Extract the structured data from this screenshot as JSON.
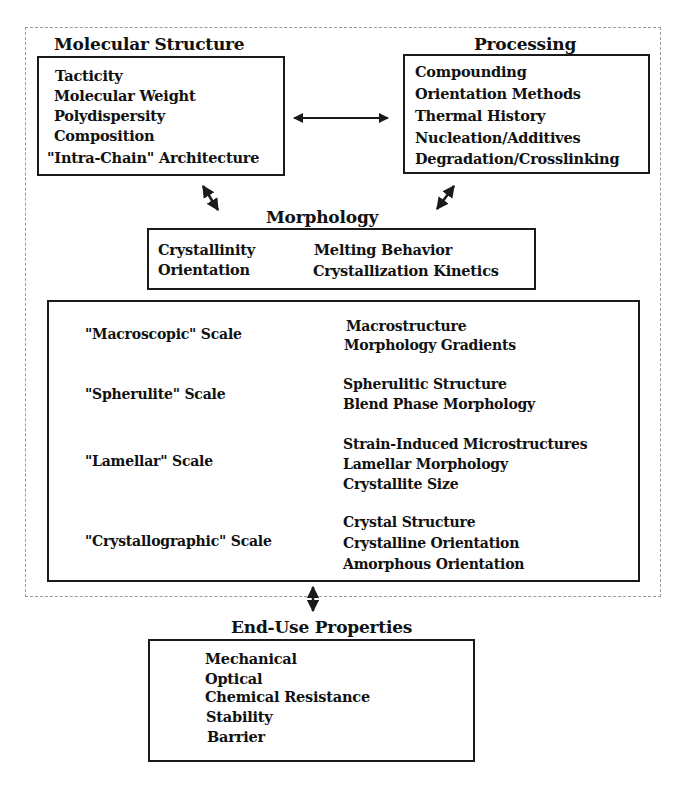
{
  "diagram": {
    "molecular_structure": {
      "title": "Molecular Structure",
      "items": [
        "Tacticity",
        "Molecular Weight",
        "Polydispersity",
        "Composition",
        "\"Intra-Chain\" Architecture"
      ]
    },
    "processing": {
      "title": "Processing",
      "items": [
        "Compounding",
        "Orientation Methods",
        "Thermal History",
        "Nucleation/Additives",
        "Degradation/Crosslinking"
      ]
    },
    "morphology": {
      "title": "Morphology",
      "left_items": [
        "Crystallinity",
        "Orientation"
      ],
      "right_items": [
        "Melting Behavior",
        "Crystallization Kinetics"
      ]
    },
    "scales": [
      {
        "label": "\"Macroscopic\" Scale",
        "items": [
          "Macrostructure",
          "Morphology Gradients"
        ]
      },
      {
        "label": "\"Spherulite\" Scale",
        "items": [
          "Spherulitic Structure",
          "Blend Phase Morphology"
        ]
      },
      {
        "label": "\"Lamellar\" Scale",
        "items": [
          "Strain-Induced Microstructures",
          "Lamellar Morphology",
          "Crystallite Size"
        ]
      },
      {
        "label": "\"Crystallographic\" Scale",
        "items": [
          "Crystal Structure",
          "Crystalline Orientation",
          "Amorphous Orientation"
        ]
      }
    ],
    "end_use": {
      "title": "End-Use Properties",
      "items": [
        "Mechanical",
        "Optical",
        "Chemical Resistance",
        "Stability",
        "Barrier"
      ]
    },
    "connectors": [
      {
        "from": "molecular_structure",
        "to": "processing",
        "type": "double-arrow"
      },
      {
        "from": "molecular_structure",
        "to": "morphology",
        "type": "double-arrow"
      },
      {
        "from": "processing",
        "to": "morphology",
        "type": "double-arrow"
      },
      {
        "from": "morphology_scales",
        "to": "end_use",
        "type": "double-arrow"
      }
    ],
    "colors": {
      "line": "#1a1a1a",
      "dashed_border": "#9a9a9a",
      "background": "#ffffff"
    }
  }
}
